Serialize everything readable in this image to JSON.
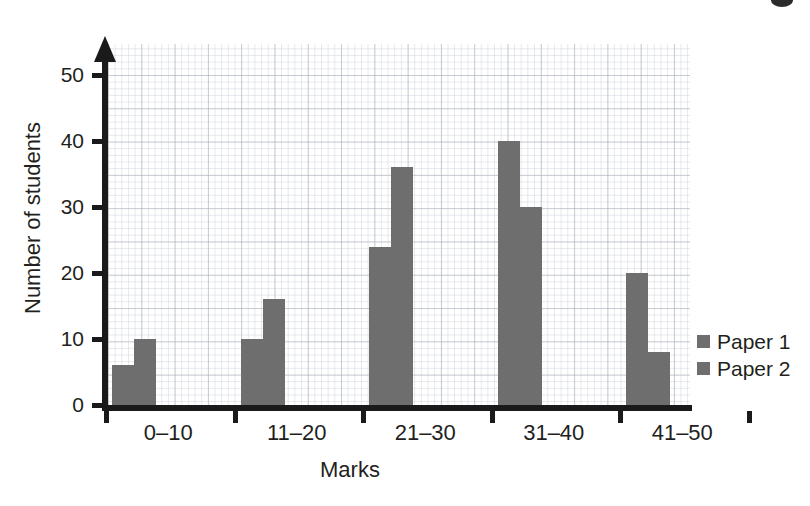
{
  "chart_data": {
    "type": "bar",
    "title": "",
    "subtitle": "",
    "xlabel": "Marks",
    "ylabel": "Number of students",
    "categories": [
      "0–10",
      "11–20",
      "21–30",
      "31–40",
      "41–50"
    ],
    "series": [
      {
        "name": "Paper 1",
        "values": [
          6,
          10,
          24,
          40,
          20
        ],
        "color": "#6e6e6e"
      },
      {
        "name": "Paper 2",
        "values": [
          10,
          16,
          36,
          30,
          8
        ],
        "color": "#6e6e6e"
      }
    ],
    "ylim": [
      0,
      55
    ],
    "ytick_labels": [
      "0",
      "10",
      "20",
      "30",
      "40",
      "50"
    ],
    "ytick_values": [
      0,
      10,
      20,
      30,
      40,
      50
    ],
    "grid": true,
    "grid_style": "graph-paper",
    "legend_position": "right",
    "legend": [
      {
        "label": "Paper 1",
        "swatch": "#6e6e6e"
      },
      {
        "label": "Paper 2",
        "swatch": "#6e6e6e"
      }
    ],
    "axis_color": "#1a1a1a",
    "has_y_axis_arrow": true
  },
  "axes": {
    "y_title": "Number of students",
    "x_title": "Marks"
  },
  "colors": {
    "bar_fill": "#6e6e6e",
    "axis": "#1a1a1a",
    "text": "#231f20",
    "grid_major": "#aab0ba",
    "grid_minor": "#c4cad4",
    "background": "#ffffff"
  }
}
